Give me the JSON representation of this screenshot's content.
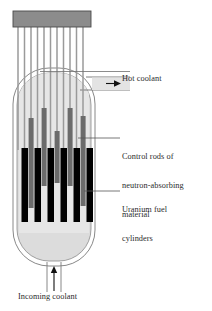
{
  "figure": {
    "background_color": "#ffffff"
  },
  "labels": {
    "hot_coolant": "Hot coolant",
    "control_rods_line1": "Control rods of",
    "control_rods_line2": "neutron-absorbing",
    "control_rods_line3": "material",
    "uranium_line1": "Uranium fuel",
    "uranium_line2": "cylinders",
    "incoming_coolant": "Incoming coolant"
  },
  "colors": {
    "text": "#2b2b2b",
    "outline": "#6b6b6b",
    "drive_plate": "#8c8c8c",
    "drive_plate_edge": "#5a5a5a",
    "drive_shaft": "#9a9a9a",
    "vessel_fill": "#d9d9d9",
    "coolant_fill": "#e3e3e3",
    "control_rod": "#6f6f6f",
    "fuel_cylinder": "#000000",
    "leader_line": "#555555",
    "arrow": "#111111"
  },
  "components": {
    "drive_plate": {
      "label": "control-rod drive plate",
      "x": 13,
      "y": 11,
      "width": 78,
      "height": 16
    },
    "drive_shafts": {
      "label": "control rod drive shafts",
      "count": 11,
      "x_positions": [
        18,
        25,
        31.5,
        38,
        44.5,
        51,
        57.5,
        64,
        70.5,
        77,
        83.5
      ],
      "top": 27,
      "bottom": 160
    },
    "pressure_vessel": {
      "label": "reactor pressure vessel",
      "left": 13,
      "right": 95,
      "top": 68,
      "bottom": 266,
      "corner_radius": 36
    },
    "control_rods": {
      "label": "control rods of neutron-absorbing material",
      "count": 5,
      "x_positions": [
        31,
        44,
        57,
        70,
        83
      ],
      "width": 5.5
    },
    "fuel_cylinders": {
      "label": "uranium fuel cylinders",
      "count": 6,
      "x_positions": [
        22,
        35,
        48,
        61,
        74,
        87
      ],
      "width": 7,
      "top": 148,
      "bottom": 222
    },
    "hot_coolant_outlet": {
      "label": "hot coolant outlet pipe",
      "y_top": 77,
      "y_bottom": 90,
      "x_end": 130
    },
    "incoming_coolant_inlet": {
      "label": "incoming coolant inlet pipe",
      "x": 54,
      "y_top": 262,
      "y_bottom": 292
    }
  },
  "arrows": [
    {
      "name": "hot-coolant-arrow",
      "direction": "right",
      "x1": 108,
      "y1": 83,
      "x2": 120,
      "y2": 83
    },
    {
      "name": "incoming-coolant-arrow",
      "direction": "up",
      "x1": 54,
      "y1": 288,
      "x2": 54,
      "y2": 270
    }
  ],
  "leaders": [
    {
      "name": "hot-coolant-leader",
      "from_x": 48,
      "from_y": 77,
      "to_x": 130,
      "to_y": 77
    },
    {
      "name": "control-rods-leader",
      "from_x": 74,
      "from_y": 148,
      "to_x": 120,
      "to_y": 148
    },
    {
      "name": "uranium-leader",
      "from_x": 86,
      "from_y": 192,
      "to_x": 120,
      "to_y": 192
    }
  ]
}
